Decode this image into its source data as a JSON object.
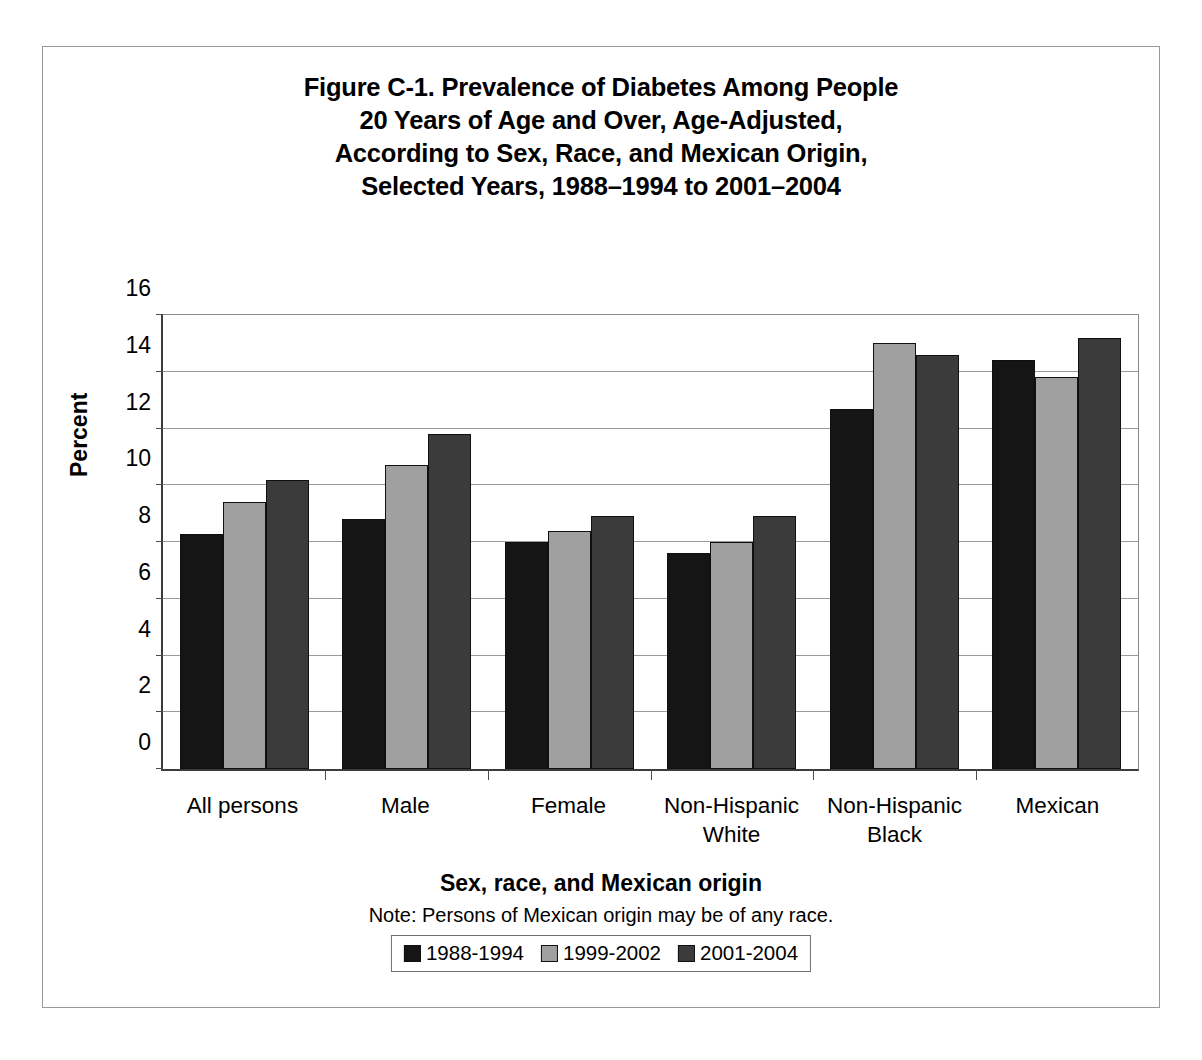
{
  "figure": {
    "title_lines": [
      "Figure C-1. Prevalence of Diabetes Among People",
      "20 Years of Age and Over, Age-Adjusted,",
      "According to Sex, Race, and Mexican Origin,",
      "Selected Years, 1988–1994 to 2001–2004"
    ],
    "note": "Note: Persons of Mexican origin may be of any race."
  },
  "chart_data": {
    "type": "bar",
    "title": "Figure C-1. Prevalence of Diabetes Among People 20 Years of Age and Over, Age-Adjusted, According to Sex, Race, and Mexican Origin, Selected Years, 1988–1994 to 2001–2004",
    "xlabel": "Sex, race, and Mexican origin",
    "ylabel": "Percent",
    "ylim": [
      0,
      16
    ],
    "yticks": [
      0,
      2,
      4,
      6,
      8,
      10,
      12,
      14,
      16
    ],
    "ytick_labels": [
      "0",
      "2",
      "4",
      "6",
      "8",
      "10",
      "12",
      "14",
      "16"
    ],
    "grid": true,
    "legend_position": "bottom",
    "categories": [
      "All persons",
      "Male",
      "Female",
      "Non-Hispanic White",
      "Non-Hispanic Black",
      "Mexican"
    ],
    "category_label_lines": [
      [
        "All persons"
      ],
      [
        "Male"
      ],
      [
        "Female"
      ],
      [
        "Non-Hispanic",
        "White"
      ],
      [
        "Non-Hispanic",
        "Black"
      ],
      [
        "Mexican"
      ]
    ],
    "series": [
      {
        "name": "1988-1994",
        "color": "#151515",
        "values": [
          8.3,
          8.8,
          8.0,
          7.6,
          12.7,
          14.4
        ]
      },
      {
        "name": "1999-2002",
        "color": "#a0a0a0",
        "values": [
          9.4,
          10.7,
          8.4,
          8.0,
          15.0,
          13.8
        ]
      },
      {
        "name": "2001-2004",
        "color": "#3b3b3b",
        "values": [
          10.2,
          11.8,
          8.9,
          8.9,
          14.6,
          15.2
        ]
      }
    ]
  }
}
